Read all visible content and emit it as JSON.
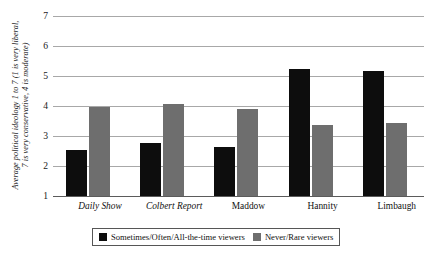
{
  "chart_data": {
    "type": "bar",
    "title": "",
    "xlabel": "",
    "ylabel": "Average political ideology 1 to 7 (1 is very liberal, 7 is very conservative, 4 is moderate)",
    "ylabel_line1": "Average political ideology 1 to 7 (1 is very liberal,",
    "ylabel_line2": "7 is very conservative, 4 is moderate)",
    "ylim": [
      1,
      7
    ],
    "yticks": [
      7,
      6,
      5,
      4,
      3,
      2,
      1
    ],
    "grid": true,
    "legend_position": "below-axis-center",
    "categories": [
      "Daily Show",
      "Colbert Report",
      "Maddow",
      "Hannity",
      "Limbaugh"
    ],
    "series": [
      {
        "name": "Sometimes/Often/All-the-time viewers",
        "color": "#0d0d0d",
        "values": [
          2.55,
          2.77,
          2.62,
          5.25,
          5.17
        ]
      },
      {
        "name": "Never/Rare viewers",
        "color": "#6e6e6e",
        "values": [
          3.98,
          4.08,
          3.89,
          3.37,
          3.43
        ]
      }
    ]
  },
  "axis": {
    "tick_labels": [
      "7",
      "6",
      "5",
      "4",
      "3",
      "2",
      "1"
    ]
  },
  "legend": {
    "items": [
      {
        "label": "Sometimes/Often/All-the-time viewers",
        "color": "#0d0d0d"
      },
      {
        "label": "Never/Rare viewers",
        "color": "#6e6e6e"
      }
    ]
  }
}
